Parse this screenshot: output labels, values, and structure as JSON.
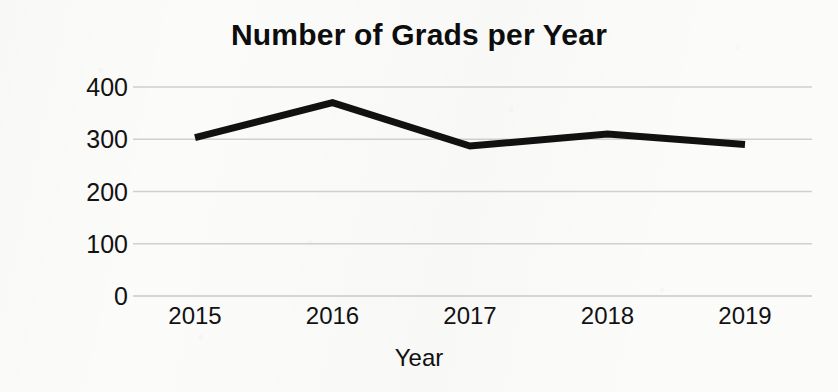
{
  "chart_data": {
    "type": "line",
    "title": "Number of Grads per Year",
    "xlabel": "Year",
    "ylabel": "Grads per Year",
    "categories": [
      "2015",
      "2016",
      "2017",
      "2018",
      "2019"
    ],
    "values": [
      303,
      370,
      287,
      310,
      290
    ],
    "series": [
      {
        "name": "Grads per Year",
        "values": [
          303,
          370,
          287,
          310,
          290
        ]
      }
    ],
    "ylim": [
      0,
      400
    ],
    "y_ticks": [
      0,
      100,
      200,
      300,
      400
    ],
    "y_tick_labels": [
      "0",
      "100",
      "200",
      "300",
      "400"
    ],
    "x_tick_labels": [
      "2015",
      "2016",
      "2017",
      "2018",
      "2019"
    ],
    "grid": "horizontal-only",
    "legend": "none",
    "line_color": "#111111",
    "grid_color": "#c9c9c9",
    "background_color": "#fbfbfa",
    "text_color": "#121212"
  }
}
